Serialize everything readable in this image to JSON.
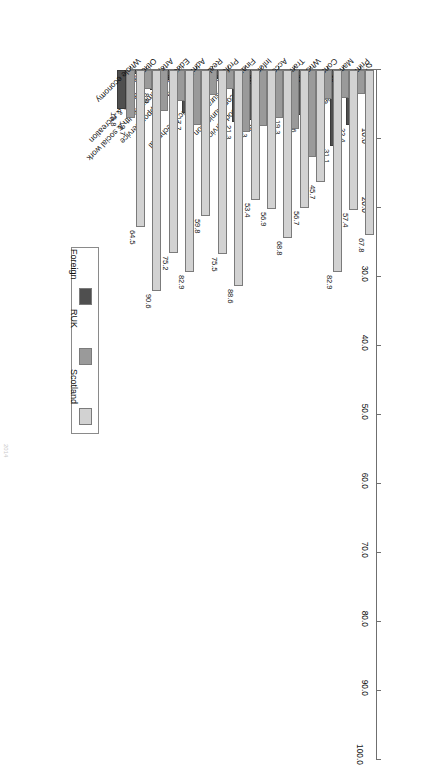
{
  "chart_data": {
    "type": "bar",
    "orientation": "horizontal-grouped",
    "title": "",
    "xlabel": "",
    "ylabel": "",
    "ylim": [
      0.0,
      100.0
    ],
    "grid": false,
    "legend_position": "right",
    "tick_labels": [
      "0.0",
      "10.0",
      "20.0",
      "30.0",
      "40.0",
      "50.0",
      "60.0",
      "70.0",
      "80.0",
      "90.0",
      "100.0"
    ],
    "tick_values": [
      0,
      10,
      20,
      30,
      40,
      50,
      60,
      70,
      80,
      90,
      100
    ],
    "categories": [
      "Primary Industries",
      "Manufacturing",
      "Construction",
      "Wholesale & retail trade etc",
      "Transportation & storage",
      "Accommodation & food service",
      "Information & communication",
      "Financial & insurance",
      "Professional, scientific & technical",
      "Real estate",
      "Administrative & support service",
      "Education, human health & social work",
      "Arts, entertainment & recreation",
      "Other service",
      "Whole economy"
    ],
    "series": [
      {
        "name": "Scotland",
        "color": "#d2d2d2",
        "values": [
          67.8,
          57.4,
          82.9,
          45.7,
          56.7,
          68.8,
          56.9,
          53.4,
          88.6,
          75.5,
          59.8,
          82.9,
          75.2,
          90.6,
          64.5
        ]
      },
      {
        "name": "RUK",
        "color": "#9a9a9a",
        "values": [
          9.7,
          11.5,
          11.8,
          35.7,
          24.0,
          19.6,
          22.8,
          25.4,
          7.9,
          10.4,
          22.5,
          12.9,
          16.8,
          7.7,
          19.7
        ]
      },
      {
        "name": "Foreign",
        "color": "#4f4f4f",
        "values": [
          22.4,
          31.1,
          5.3,
          18.6,
          19.3,
          11.7,
          20.3,
          21.3,
          3.5,
          14.1,
          17.7,
          4.2,
          8.0,
          1.7,
          15.8
        ]
      }
    ],
    "value_labels": [
      [
        "67.8",
        "9.7",
        "22.4"
      ],
      [
        "57.4",
        "11.5",
        "31.1"
      ],
      [
        "82.9",
        "11.8",
        "5.3"
      ],
      [
        "45.7",
        "35.7",
        "18.6"
      ],
      [
        "56.7",
        "24.0",
        "19.3"
      ],
      [
        "68.8",
        "19.6",
        "11.7"
      ],
      [
        "56.9",
        "22.8",
        "20.3"
      ],
      [
        "53.4",
        "25.4",
        "21.3"
      ],
      [
        "88.6",
        "7.9",
        "3.5"
      ],
      [
        "75.5",
        "10.4",
        "14.1"
      ],
      [
        "59.8",
        "22.5",
        "17.7"
      ],
      [
        "82.9",
        "12.9",
        "4.2"
      ],
      [
        "75.2",
        "16.8",
        "8.0"
      ],
      [
        "90.6",
        "7.7",
        "1.7"
      ],
      [
        "64.5",
        "19.7",
        "15.8"
      ]
    ]
  },
  "legend": {
    "items": [
      {
        "label": "Scotland",
        "color": "#d2d2d2"
      },
      {
        "label": "RUK",
        "color": "#9a9a9a"
      },
      {
        "label": "Foreign",
        "color": "#4f4f4f"
      }
    ]
  },
  "caption": {
    "text": "2014"
  }
}
